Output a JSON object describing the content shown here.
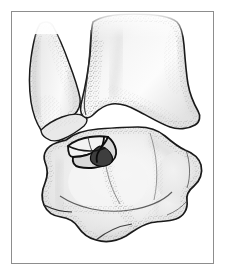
{
  "figure": {
    "title": "Ankle joint osteochondral lesion illustration",
    "style": "stippled pen-and-ink medical illustration",
    "background_color": "#ffffff",
    "frame_color": "#8d8d8d",
    "outline_color": "#1a1a1a",
    "bone_fill_color": "#eeeeee",
    "bone_shade_color": "#dcdcdc",
    "stipple_color": "#a9a9a9",
    "lesion_fill_color": "#4a4a4a",
    "labels": []
  },
  "structures": [
    {
      "id": "fibula",
      "name": "distal-fibula-lateral-malleolus",
      "label": "",
      "position": "upper-left",
      "fill": "#efefef"
    },
    {
      "id": "tibia",
      "name": "distal-tibia-medial-malleolus",
      "label": "",
      "position": "upper-right",
      "fill": "#efefef"
    },
    {
      "id": "talus",
      "name": "talus",
      "label": "",
      "position": "lower-center",
      "fill": "#ececec"
    },
    {
      "id": "lesion",
      "name": "osteochondral-fracture-fragment",
      "label": "",
      "position": "superomedial-talar-dome",
      "fill": "#4a4a4a"
    }
  ]
}
